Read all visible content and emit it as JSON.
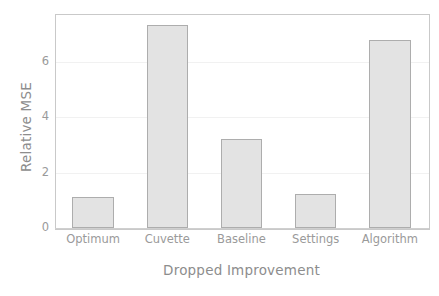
{
  "chart_data": {
    "type": "bar",
    "title": "",
    "subtitle": "",
    "xlabel": "Dropped Improvement",
    "ylabel": "Relative MSE",
    "categories": [
      "Optimum",
      "Cuvette",
      "Baseline",
      "Settings",
      "Algorithm"
    ],
    "values": [
      1.1,
      7.33,
      3.19,
      1.24,
      6.76
    ],
    "ylim": [
      0,
      7.7
    ],
    "xlim_note": "categorical",
    "yticks": [
      0,
      2,
      4,
      6
    ],
    "ytick_labels": [
      "0",
      "2",
      "4",
      "6"
    ],
    "xtick_labels": [
      "Optimum",
      "Cuvette",
      "Baseline",
      "Settings",
      "Algorithm"
    ],
    "grid": true,
    "grid_axis": "y",
    "legend": null,
    "legend_position": "none",
    "bar_face_color": "#e3e3e3",
    "bar_edge_color": "#adadad",
    "grid_color": "#f1f1f1",
    "axis_color": "#c9c9c9",
    "tick_label_color": "#9a9a9a",
    "axis_label_color": "#8d8d8d",
    "background_color": "#ffffff"
  }
}
